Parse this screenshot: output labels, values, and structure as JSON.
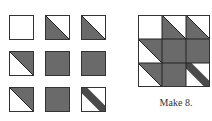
{
  "colors": {
    "dark": "#6a6a6a",
    "light": "#ffffff",
    "outline": "#333333"
  },
  "units": [
    {
      "row": 0,
      "col": 0,
      "type": "plain"
    },
    {
      "row": 0,
      "col": 1,
      "type": "hst-lower-left"
    },
    {
      "row": 0,
      "col": 2,
      "type": "hst-lower-left"
    },
    {
      "row": 1,
      "col": 0,
      "type": "hst-upper-right"
    },
    {
      "row": 1,
      "col": 1,
      "type": "solid"
    },
    {
      "row": 1,
      "col": 2,
      "type": "solid"
    },
    {
      "row": 2,
      "col": 0,
      "type": "hst-upper-right"
    },
    {
      "row": 2,
      "col": 1,
      "type": "solid"
    },
    {
      "row": 2,
      "col": 2,
      "type": "stem"
    }
  ],
  "caption": "Make 8."
}
